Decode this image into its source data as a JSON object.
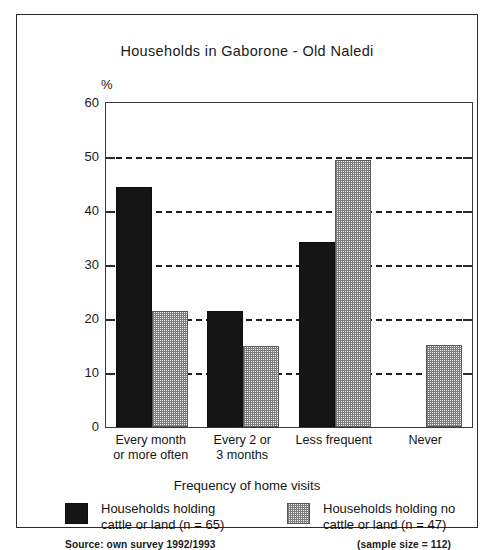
{
  "chart_data": {
    "type": "bar",
    "title": "Households in Gaborone - Old Naledi",
    "xlabel": "Frequency of home visits",
    "ylabel": "%",
    "ylim": [
      0,
      60
    ],
    "yticks": [
      0,
      10,
      20,
      30,
      40,
      50,
      60
    ],
    "grid": true,
    "grid_axis": "y",
    "legend_position": "bottom",
    "categories": [
      "Every month\nor more often",
      "Every 2 or\n3 months",
      "Less frequent",
      "Never"
    ],
    "series": [
      {
        "name": "Households holding\ncattle or land (n = 65)",
        "values": [
          44.5,
          21.5,
          34.3,
          0
        ]
      },
      {
        "name": "Households holding no\ncattle or land (n = 47)",
        "values": [
          21.4,
          15.0,
          49.4,
          15.2
        ]
      }
    ],
    "source": "Source: own survey 1992/1993",
    "sample_note": "(sample size = 112)"
  },
  "chart": {
    "title": "Households in Gaborone - Old Naledi",
    "percent_symbol": "%",
    "x_axis_title": "Frequency of home visits",
    "y_tick_labels": [
      "60",
      "50",
      "40",
      "30",
      "20",
      "10",
      "0"
    ],
    "category_labels": [
      {
        "line1": "Every month",
        "line2": "or more often"
      },
      {
        "line1": "Every 2 or",
        "line2": "3 months"
      },
      {
        "line1": "Less frequent",
        "line2": ""
      },
      {
        "line1": "Never",
        "line2": ""
      }
    ],
    "legend": [
      {
        "swatch": "solid-black-swatch",
        "label": "Households holding\ncattle or land (n = 65)"
      },
      {
        "swatch": "dotted-gray-swatch",
        "label": "Households holding no\ncattle or land (n = 47)"
      }
    ],
    "source_note": "Source: own survey 1992/1993",
    "sample_note": "(sample size = 112)"
  },
  "colors": {
    "series_one": "#151515",
    "series_two": "#b8b8b8",
    "frame": "#2b2b2b",
    "background": "#ffffff"
  }
}
